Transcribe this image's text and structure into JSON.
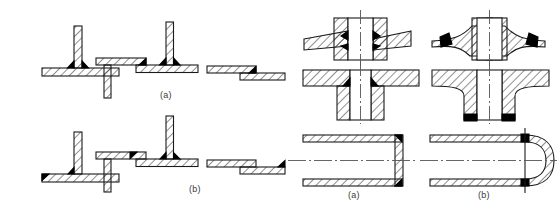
{
  "figure": {
    "background_color": "#ffffff",
    "line_color": "#1a1a1a",
    "hatch_color": "#333333",
    "weld_color": "#000000",
    "centerline_color": "#555555",
    "caption_color": "#3a3a3a"
  },
  "panels": {
    "left_group": {
      "name": "plate-joint-group",
      "rows": [
        {
          "label": "(a)",
          "row_id": "row-a",
          "description": "Unfavourable / first-variant fillet-welded plate joints",
          "items": [
            {
              "id": "tee-joint",
              "name": "tee-joint-plate",
              "weld_count": 2,
              "weld_position": "both-sides-of-web-at-top-face"
            },
            {
              "id": "stepped-lap-joint",
              "name": "stepped-lap-plate-joint",
              "weld_count": 2,
              "weld_position": "step-edge-and-web-root"
            },
            {
              "id": "lap-joint",
              "name": "lap-plate-joint",
              "weld_count": 1,
              "weld_position": "overlap-edge"
            }
          ]
        },
        {
          "label": "(b)",
          "row_id": "row-b",
          "description": "Favourable / second-variant fillet-welded plate joints",
          "items": [
            {
              "id": "tee-joint",
              "name": "tee-joint-plate",
              "weld_count": 2,
              "weld_position": "end-of-base-plate-and-web-root"
            },
            {
              "id": "stepped-lap-joint",
              "name": "stepped-lap-plate-joint",
              "weld_count": 2,
              "weld_position": "top-face-of-base-plate"
            },
            {
              "id": "lap-joint",
              "name": "lap-plate-joint",
              "weld_count": 1,
              "weld_position": "far-overlap-edge"
            }
          ]
        }
      ]
    },
    "right_group": {
      "name": "hub-and-vessel-group",
      "columns": [
        {
          "label": "(a)",
          "column_id": "col-a",
          "description": "Welded-on hub and flat vessel end"
        },
        {
          "label": "(b)",
          "column_id": "col-b",
          "description": "Integrally forged hub and dished vessel end"
        }
      ],
      "rows": [
        {
          "row_id": "hub-disc-row",
          "name": "hub-on-tapered-disc",
          "variants": [
            {
              "label": "(a)",
              "weld_count": 2,
              "style": "welded-collar-with-fillet-welds"
            },
            {
              "label": "(b)",
              "weld_count": 2,
              "style": "forged-transition-welds-at-rim"
            }
          ]
        },
        {
          "row_id": "hub-flange-row",
          "name": "tubular-hub-on-flat-flange",
          "variants": [
            {
              "label": "(a)",
              "weld_count": 2,
              "style": "fillet-welds-at-hub-to-plate-junction"
            },
            {
              "label": "(b)",
              "weld_count": 2,
              "style": "forged-fillet-with-butt-welds-below"
            }
          ]
        },
        {
          "row_id": "vessel-end-row",
          "name": "cylindrical-vessel-end-closure",
          "variants": [
            {
              "label": "(a)",
              "weld_count": 2,
              "style": "flat-end-plate-corner-welds"
            },
            {
              "label": "(b)",
              "weld_count": 2,
              "style": "dished-hemispherical-end-butt-welds"
            }
          ]
        }
      ]
    }
  },
  "captions": {
    "left_a": "(a)",
    "left_b": "(b)",
    "right_a": "(a)",
    "right_b": "(b)"
  }
}
